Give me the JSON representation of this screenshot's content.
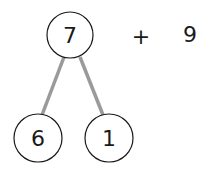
{
  "diagram": {
    "type": "number-bond",
    "top": {
      "label": "7",
      "cx": 70,
      "cy": 35,
      "r": 23
    },
    "children": [
      {
        "label": "6",
        "cx": 38,
        "cy": 138,
        "r": 24
      },
      {
        "label": "1",
        "cx": 109,
        "cy": 138,
        "r": 24
      }
    ],
    "operator": "+",
    "addend": "9",
    "colors": {
      "line": "#9a9a9a",
      "circle": "#1a1a1a",
      "text": "#1a1a1a"
    }
  }
}
